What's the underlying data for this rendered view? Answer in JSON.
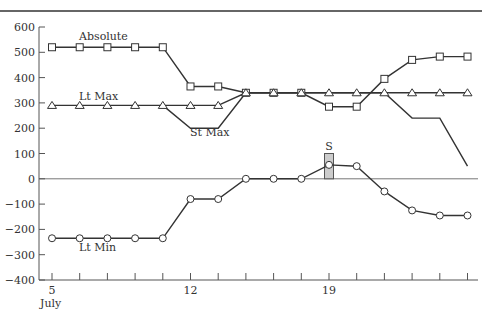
{
  "chart_data": {
    "type": "line",
    "title": "",
    "xlabel": "July",
    "ylabel": "",
    "ylim": [
      -400,
      600
    ],
    "yticks": [
      600,
      500,
      400,
      300,
      200,
      100,
      0,
      -100,
      -200,
      -300,
      -400
    ],
    "x_tick_count": 16,
    "x_tick_labels": [
      {
        "index": 0,
        "label": "5",
        "sublabel": "July"
      },
      {
        "index": 5,
        "label": "12"
      },
      {
        "index": 10,
        "label": "19"
      }
    ],
    "x": [
      0,
      1,
      2,
      3,
      4,
      5,
      6,
      7,
      8,
      9,
      10,
      11,
      12,
      13,
      14,
      15
    ],
    "grid": false,
    "zero_line": true,
    "series": [
      {
        "name": "Absolute",
        "marker": "square",
        "values": [
          520,
          520,
          520,
          520,
          520,
          365,
          365,
          340,
          340,
          340,
          285,
          285,
          395,
          470,
          483,
          483
        ],
        "label_pos": {
          "x": 79,
          "y": 40
        }
      },
      {
        "name": "Lt Max",
        "marker": "triangle",
        "values": [
          290,
          290,
          290,
          290,
          290,
          290,
          290,
          340,
          340,
          340,
          340,
          340,
          340,
          340,
          340,
          340
        ],
        "label_pos": {
          "x": 79,
          "y": 100
        }
      },
      {
        "name": "St Max",
        "marker": "none",
        "values": [
          null,
          null,
          null,
          null,
          290,
          200,
          200,
          340,
          340,
          340,
          340,
          340,
          340,
          240,
          240,
          50
        ],
        "label_pos": {
          "x": 190,
          "y": 136
        }
      },
      {
        "name": "Lt Min",
        "marker": "circle",
        "values": [
          -235,
          -235,
          -235,
          -235,
          -235,
          -80,
          -80,
          0,
          0,
          0,
          55,
          50,
          -50,
          -125,
          -145,
          -145
        ],
        "label_pos": {
          "x": 79,
          "y": 251
        }
      }
    ],
    "annotations": [
      {
        "label": "S",
        "type": "bar",
        "index": 10,
        "from": 0,
        "to": 100,
        "color": "#cccccc"
      }
    ]
  },
  "colors": {
    "line": "#333333",
    "marker_fill": "#ffffff",
    "bar_fill": "#cccccc",
    "axis": "#555555"
  }
}
